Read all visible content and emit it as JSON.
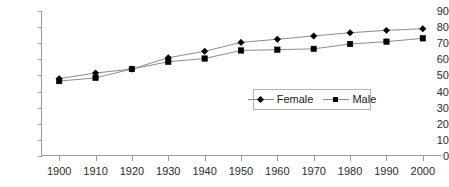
{
  "chart_data": {
    "type": "line",
    "title": "",
    "subtitle": "",
    "xlabel": "",
    "ylabel": "",
    "xlim": [
      1895,
      2005
    ],
    "ylim": [
      0,
      90
    ],
    "grid": false,
    "legend_position": "inside-center-right",
    "categories": [
      1900,
      1910,
      1920,
      1930,
      1940,
      1950,
      1960,
      1970,
      1980,
      1990,
      2000
    ],
    "x_tick_labels": [
      "1900",
      "1910",
      "1920",
      "1930",
      "1940",
      "1950",
      "1960",
      "1970",
      "1980",
      "1990",
      "2000"
    ],
    "y_tick_labels": [
      "0",
      "10",
      "20",
      "30",
      "40",
      "50",
      "60",
      "70",
      "80",
      "90"
    ],
    "y_ticks": [
      0,
      10,
      20,
      30,
      40,
      50,
      60,
      70,
      80,
      90
    ],
    "series": [
      {
        "name": "Female",
        "marker": "diamond",
        "color": "#000000",
        "line_color": "#8c8c8c",
        "values": [
          48.0,
          51.5,
          54.0,
          61.0,
          65.0,
          70.5,
          72.5,
          74.5,
          76.5,
          78.0,
          79.0
        ]
      },
      {
        "name": "Male",
        "marker": "square",
        "color": "#000000",
        "line_color": "#8c8c8c",
        "values": [
          46.5,
          48.5,
          54.0,
          58.5,
          60.5,
          65.5,
          66.0,
          66.5,
          69.5,
          71.0,
          73.0
        ]
      }
    ]
  },
  "legend": {
    "entries": [
      {
        "label": "Female",
        "marker": "diamond"
      },
      {
        "label": "Male",
        "marker": "square"
      }
    ]
  },
  "axes": {
    "y_axis_name": "value-axis",
    "x_axis_name": "category-axis"
  }
}
